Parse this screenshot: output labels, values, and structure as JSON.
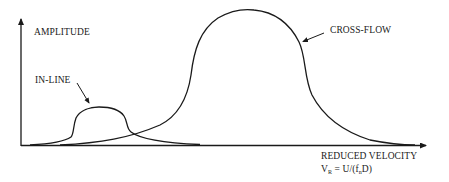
{
  "diagram": {
    "y_axis_label": "AMPLITUDE",
    "x_axis_label": "REDUCED VELOCITY",
    "formula": {
      "lhs_symbol": "V",
      "lhs_subscript": "R",
      "equals": " = U/(",
      "f_symbol": "f",
      "f_subscript": "n",
      "tail": "D)"
    },
    "curves": [
      {
        "name": "IN-LINE",
        "shape": "small bump at low reduced velocity"
      },
      {
        "name": "CROSS-FLOW",
        "shape": "large bell at higher reduced velocity"
      }
    ],
    "labels": {
      "inline": "IN-LINE",
      "crossflow": "CROSS-FLOW"
    },
    "colors": {
      "stroke": "#1a1a1a",
      "background": "#ffffff"
    }
  }
}
